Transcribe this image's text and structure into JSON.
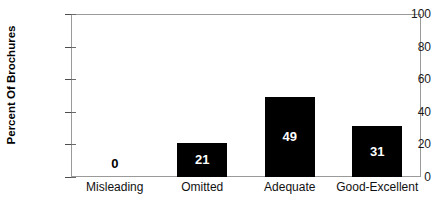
{
  "chart_data": {
    "type": "bar",
    "title": "",
    "subtitle": "",
    "xlabel": "",
    "ylabel": "Percent Of Brochures",
    "categories": [
      "Misleading",
      "Omitted",
      "Adequate",
      "Good-Excellent"
    ],
    "values": [
      0,
      21,
      49,
      31
    ],
    "value_labels": [
      "0",
      "21",
      "49",
      "31"
    ],
    "ylim": [
      0,
      100
    ],
    "yticks": [
      0,
      20,
      40,
      60,
      80,
      100
    ],
    "ytick_labels": [
      "0",
      "20",
      "40",
      "60",
      "80",
      "100"
    ],
    "grid": false,
    "legend": "none",
    "bar_color": "#000000",
    "inside_label_color": "#ffffff",
    "outside_label_color": "#000000",
    "frame_color": "#9a9a9a",
    "background_color": "#ffffff"
  }
}
